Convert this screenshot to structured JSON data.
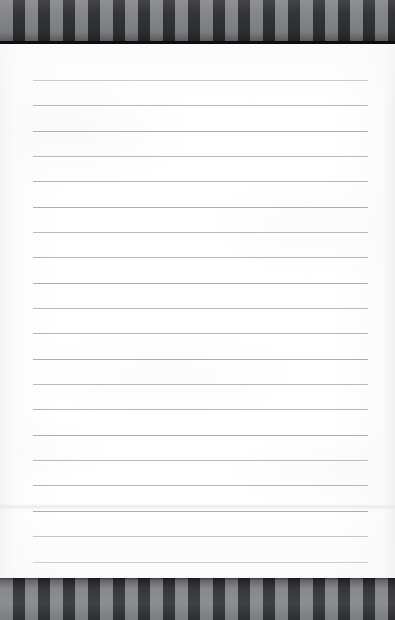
{
  "scene": {
    "kind": "photograph",
    "subject": "lined-notepad-on-striped-surface",
    "width": 395,
    "height": 620,
    "background_color": "#fbfbfb"
  },
  "surface": {
    "label": "striped-backdrop",
    "pattern": "vertical-stripes",
    "dark_color": "#2f3033",
    "light_color": "#828487",
    "edge_color": "#0d0e10",
    "stripe_width": 12.5,
    "bands": [
      {
        "name": "top-band",
        "top": 0,
        "height": 44,
        "edge_top": 41
      },
      {
        "name": "bottom-band",
        "top": 578,
        "height": 42,
        "edge_top": 578
      }
    ]
  },
  "paper": {
    "label": "ruled-notepad-page",
    "color": "#ffffff",
    "edge_color": "#f2f2f3",
    "top": 44,
    "left": 0,
    "width": 395,
    "height": 534,
    "seam_y": 504,
    "seam_color": "#e4e4e6"
  },
  "rules": {
    "label": "ruled-lines",
    "color": "#a9abb0",
    "highlight_color": "#ffffff",
    "thickness": 1,
    "left": 33,
    "right": 368,
    "first_y": 80,
    "spacing": 25.4,
    "count": 20,
    "y_positions": [
      80,
      105,
      131,
      156,
      181,
      207,
      232,
      257,
      283,
      308,
      333,
      359,
      384,
      409,
      435,
      460,
      485,
      511,
      536,
      562
    ]
  },
  "text_content": {
    "note": "no-visible-text",
    "visible_text": ""
  }
}
